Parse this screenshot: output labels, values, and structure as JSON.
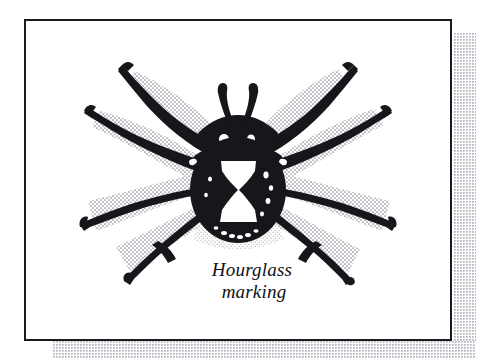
{
  "figure": {
    "kind": "line-illustration",
    "frame": {
      "border_color": "#1b1b1f",
      "background_color": "#ffffff",
      "shadow_color": "#b9bcc4",
      "shadow_style": "halftone-dots"
    },
    "caption": {
      "line1": "Hourglass",
      "line2": "marking",
      "style": "italic-serif",
      "color": "#111115"
    },
    "ink_color": "#17171b",
    "stipple_color": "#6f727c",
    "parts": {
      "abdomen": "abdomen",
      "cephalothorax": "cephalothorax",
      "hourglass": "hourglass-marking",
      "pedipalps": "pedipalps",
      "legs_left": [
        "leg-left-1",
        "leg-left-2",
        "leg-left-3",
        "leg-left-4"
      ],
      "legs_right": [
        "leg-right-1",
        "leg-right-2",
        "leg-right-3",
        "leg-right-4"
      ]
    }
  }
}
